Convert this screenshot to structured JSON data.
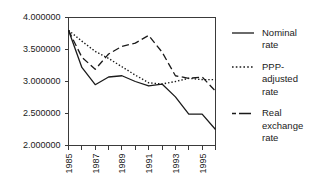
{
  "chart_data": {
    "type": "line",
    "title": "",
    "xlabel": "",
    "ylabel": "",
    "x": [
      1985,
      1986,
      1987,
      1988,
      1989,
      1990,
      1991,
      1992,
      1993,
      1994,
      1995,
      1996
    ],
    "xlim": [
      1985,
      1996
    ],
    "ylim": [
      2.0,
      4.0
    ],
    "grid": false,
    "legend_position": "right",
    "ytick_labels": [
      "4.000000",
      "3.500000",
      "3.000000",
      "2.500000",
      "2.000000"
    ],
    "ytick_values": [
      4.0,
      3.5,
      3.0,
      2.5,
      2.0
    ],
    "xtick_labels": [
      "1985",
      "",
      "1987",
      "",
      "1989",
      "",
      "1991",
      "",
      "1993",
      "",
      "1995",
      ""
    ],
    "xtick_values": [
      1985,
      1986,
      1987,
      1988,
      1989,
      1990,
      1991,
      1992,
      1993,
      1994,
      1995,
      1996
    ],
    "series": [
      {
        "name": "Nominal rate",
        "style": "solid",
        "values": [
          3.8,
          3.22,
          2.95,
          3.07,
          3.09,
          3.0,
          2.93,
          2.96,
          2.76,
          2.49,
          2.49,
          2.25
        ]
      },
      {
        "name": "PPP-adjusted rate",
        "style": "dotted",
        "values": [
          3.8,
          3.63,
          3.47,
          3.36,
          3.23,
          3.1,
          2.98,
          2.96,
          3.0,
          3.05,
          3.03,
          3.03
        ]
      },
      {
        "name": "Real exchange rate",
        "style": "dashed",
        "values": [
          3.8,
          3.38,
          3.19,
          3.43,
          3.55,
          3.6,
          3.72,
          3.46,
          3.09,
          3.05,
          3.07,
          2.85
        ]
      }
    ]
  },
  "legend": {
    "entries": [
      {
        "label_line1": "Nominal",
        "label_line2": "rate",
        "label_line3": "",
        "style": "solid"
      },
      {
        "label_line1": "PPP-",
        "label_line2": "adjusted",
        "label_line3": "rate",
        "style": "dotted"
      },
      {
        "label_line1": "Real",
        "label_line2": "exchange",
        "label_line3": "rate",
        "style": "dashed"
      }
    ]
  }
}
